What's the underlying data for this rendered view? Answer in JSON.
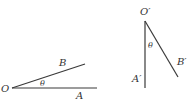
{
  "figure_left": {
    "vertex_label": "O",
    "ray1_label": "A",
    "ray2_label": "B",
    "angle_label": "θ"
  },
  "figure_right": {
    "vertex_label": "O′",
    "ray1_label": "A′",
    "ray2_label": "B′",
    "angle_label": "θ"
  },
  "colors": {
    "line": "#3a3a3a",
    "text": "#333333",
    "background": "#ffffff"
  }
}
